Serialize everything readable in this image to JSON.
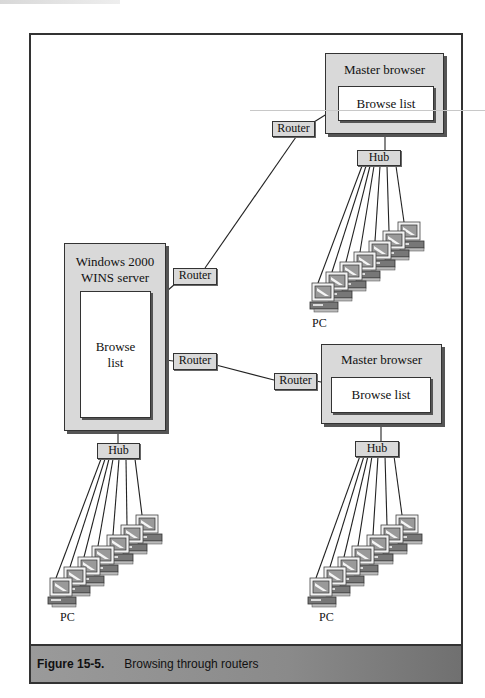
{
  "figure": {
    "number": "Figure 15-5.",
    "title": "Browsing through routers"
  },
  "nodes": {
    "wins_server": {
      "title_line1": "Windows 2000",
      "title_line2": "WINS server",
      "inner_line1": "Browse",
      "inner_line2": "list"
    },
    "master_top": {
      "title": "Master browser",
      "inner": "Browse list"
    },
    "master_bottom": {
      "title": "Master browser",
      "inner": "Browse list"
    },
    "router_upper": {
      "label": "Router"
    },
    "router_top_right": {
      "label": "Router"
    },
    "router_middle": {
      "label": "Router"
    },
    "router_bottom_right": {
      "label": "Router"
    },
    "hub_top": {
      "label": "Hub"
    },
    "hub_left": {
      "label": "Hub"
    },
    "hub_bottom": {
      "label": "Hub"
    }
  },
  "pc_clusters": [
    {
      "label": "PC",
      "count": 7
    },
    {
      "label": "PC",
      "count": 7
    },
    {
      "label": "PC",
      "count": 7
    }
  ],
  "colors": {
    "box_fill": "#d9d9d9",
    "line": "#222222",
    "caption_bg": "#8a8a8a"
  }
}
